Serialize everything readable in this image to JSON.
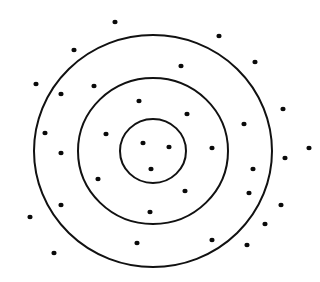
{
  "canvas": {
    "width": 320,
    "height": 282,
    "background": "#ffffff"
  },
  "style": {
    "stroke_color": "#111111",
    "dot_color": "#0a0a0a",
    "stroke_width": 2,
    "dot_radius": 2.6
  },
  "target": {
    "center": {
      "x": 153,
      "y": 151
    },
    "rings": [
      {
        "name": "inner-ring",
        "rx": 33,
        "ry": 32
      },
      {
        "name": "middle-ring",
        "rx": 75,
        "ry": 73
      },
      {
        "name": "outer-ring",
        "rx": 119,
        "ry": 116
      }
    ]
  },
  "dots": [
    {
      "x": 115,
      "y": 22
    },
    {
      "x": 219,
      "y": 36
    },
    {
      "x": 74,
      "y": 50
    },
    {
      "x": 255,
      "y": 62
    },
    {
      "x": 181,
      "y": 66
    },
    {
      "x": 36,
      "y": 84
    },
    {
      "x": 94,
      "y": 86
    },
    {
      "x": 61,
      "y": 94
    },
    {
      "x": 139,
      "y": 101
    },
    {
      "x": 283,
      "y": 109
    },
    {
      "x": 187,
      "y": 114
    },
    {
      "x": 244,
      "y": 124
    },
    {
      "x": 45,
      "y": 133
    },
    {
      "x": 106,
      "y": 134
    },
    {
      "x": 143,
      "y": 143
    },
    {
      "x": 169,
      "y": 147
    },
    {
      "x": 212,
      "y": 148
    },
    {
      "x": 309,
      "y": 148
    },
    {
      "x": 61,
      "y": 153
    },
    {
      "x": 285,
      "y": 158
    },
    {
      "x": 253,
      "y": 169
    },
    {
      "x": 151,
      "y": 169
    },
    {
      "x": 98,
      "y": 179
    },
    {
      "x": 185,
      "y": 191
    },
    {
      "x": 249,
      "y": 193
    },
    {
      "x": 281,
      "y": 205
    },
    {
      "x": 61,
      "y": 205
    },
    {
      "x": 150,
      "y": 212
    },
    {
      "x": 30,
      "y": 217
    },
    {
      "x": 265,
      "y": 224
    },
    {
      "x": 212,
      "y": 240
    },
    {
      "x": 137,
      "y": 243
    },
    {
      "x": 247,
      "y": 245
    },
    {
      "x": 54,
      "y": 253
    }
  ]
}
